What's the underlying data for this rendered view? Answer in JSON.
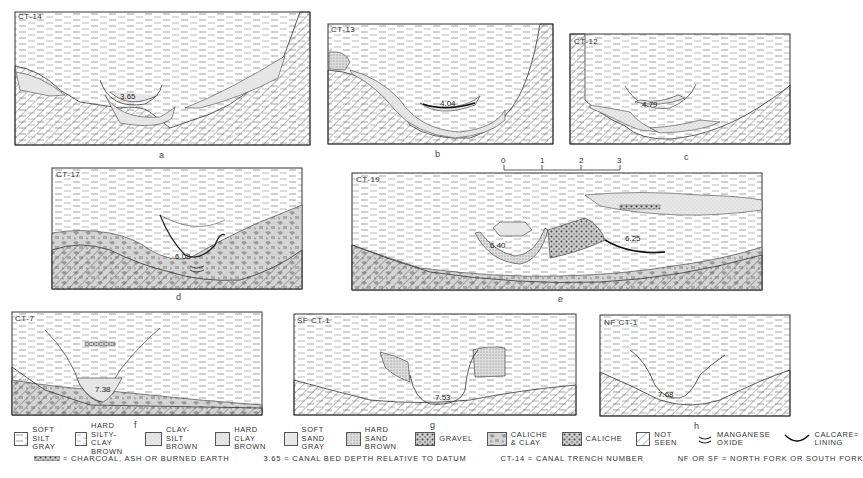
{
  "figure": {
    "panels": [
      {
        "id": "a",
        "trench": "CT-14",
        "depth": "3.65",
        "caption": "a"
      },
      {
        "id": "b",
        "trench": "CT-13",
        "depth": "4.04",
        "caption": "b"
      },
      {
        "id": "c",
        "trench": "CT-12",
        "depth": "4.79",
        "caption": "c"
      },
      {
        "id": "d",
        "trench": "CT-17",
        "depth": "6.08",
        "caption": "d"
      },
      {
        "id": "e",
        "trench": "CT-19",
        "depths": [
          "6.40",
          "6.25"
        ],
        "caption": "e"
      },
      {
        "id": "f",
        "trench": "CT-7",
        "depth": "7.38",
        "caption": "f"
      },
      {
        "id": "g",
        "trench": "SF CT-1",
        "depth": "7.53",
        "caption": "g"
      },
      {
        "id": "h",
        "trench": "NF CT-1",
        "depth": "7.68",
        "caption": "h"
      }
    ],
    "scale_bar": {
      "ticks": [
        "0",
        "1",
        "2",
        "3"
      ],
      "unit": "METERS"
    },
    "legend": {
      "items": [
        {
          "key": "soft-silt-gray",
          "text": "SOFT SILT\nGRAY"
        },
        {
          "key": "hard-silty-clay-brown",
          "text": "HARD SILTY-CLAY\nBROWN"
        },
        {
          "key": "clay-silt-brown",
          "text": "CLAY-SILT\nBROWN"
        },
        {
          "key": "hard-clay-brown",
          "text": "HARD CLAY\nBROWN"
        },
        {
          "key": "soft-sand-gray",
          "text": "SOFT SAND\nGRAY"
        },
        {
          "key": "hard-sand-brown",
          "text": "HARD SAND\nBROWN"
        },
        {
          "key": "gravel",
          "text": "GRAVEL"
        },
        {
          "key": "caliche-clay",
          "text": "CALICHE\n& CLAY"
        },
        {
          "key": "caliche",
          "text": "CALICHE"
        },
        {
          "key": "not-seen",
          "text": "NOT SEEN"
        },
        {
          "key": "manganese-oxide",
          "text": "MANGANESE\nOXIDE"
        },
        {
          "key": "calcareous-lining",
          "text": "CALCARE=\nLINING"
        }
      ],
      "notes": [
        "= CHARCOAL, ASH OR BURNED EARTH",
        "3.65 = CANAL BED DEPTH RELATIVE TO DATUM",
        "CT-14 = CANAL TRENCH NUMBER",
        "NF OR SF = NORTH FORK OR SOUTH FORK"
      ]
    }
  }
}
